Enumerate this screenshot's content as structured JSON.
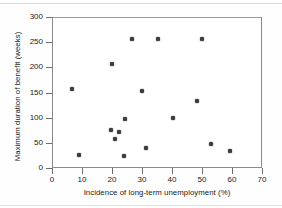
{
  "chart_data": {
    "type": "scatter",
    "title": "",
    "xlabel": "Incidence of long-term unemployment (%)",
    "ylabel": "Maximum duration of benefit (weeks)",
    "xlim": [
      0,
      70
    ],
    "ylim": [
      0,
      300
    ],
    "xticks": [
      0,
      10,
      20,
      30,
      40,
      50,
      60,
      70
    ],
    "yticks": [
      0,
      50,
      100,
      150,
      200,
      250,
      300
    ],
    "grid": false,
    "legend": null,
    "marker_color": "#3c3c3c",
    "points": [
      {
        "x": 6.3,
        "y": 159
      },
      {
        "x": 8.7,
        "y": 27
      },
      {
        "x": 19.3,
        "y": 78
      },
      {
        "x": 19.7,
        "y": 208
      },
      {
        "x": 20.7,
        "y": 60
      },
      {
        "x": 22.0,
        "y": 74
      },
      {
        "x": 23.7,
        "y": 26
      },
      {
        "x": 24.0,
        "y": 100
      },
      {
        "x": 26.3,
        "y": 259
      },
      {
        "x": 29.7,
        "y": 155
      },
      {
        "x": 31.0,
        "y": 42
      },
      {
        "x": 35.0,
        "y": 259
      },
      {
        "x": 40.0,
        "y": 101
      },
      {
        "x": 48.0,
        "y": 135
      },
      {
        "x": 49.7,
        "y": 258
      },
      {
        "x": 52.7,
        "y": 49
      },
      {
        "x": 59.0,
        "y": 36
      }
    ]
  },
  "axes": {
    "x_tick_labels": [
      "0",
      "10",
      "20",
      "30",
      "40",
      "50",
      "60",
      "70"
    ],
    "y_tick_labels": [
      "0",
      "50",
      "100",
      "150",
      "200",
      "250",
      "300"
    ]
  }
}
